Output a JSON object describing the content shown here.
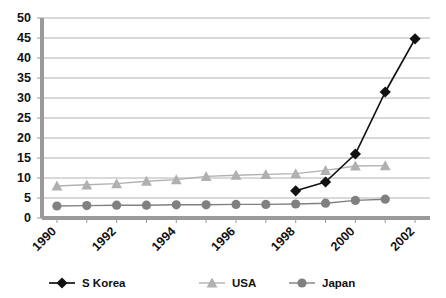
{
  "chart_data": {
    "type": "line",
    "title": "",
    "subtitle": "",
    "xlabel": "",
    "ylabel": "",
    "x": [
      1990,
      1991,
      1992,
      1993,
      1994,
      1995,
      1996,
      1997,
      1998,
      1999,
      2000,
      2001,
      2002
    ],
    "categories": [
      "1990",
      "1991",
      "1992",
      "1993",
      "1994",
      "1995",
      "1996",
      "1997",
      "1998",
      "1999",
      "2000",
      "2001",
      "2002"
    ],
    "xtick_labels": [
      "1990",
      "1992",
      "1994",
      "1996",
      "1998",
      "2000",
      "2002"
    ],
    "xtick_values": [
      1990,
      1992,
      1994,
      1996,
      1998,
      2000,
      2002
    ],
    "ytick_labels": [
      "0",
      "5",
      "10",
      "15",
      "20",
      "25",
      "30",
      "35",
      "40",
      "45",
      "50"
    ],
    "ytick_values": [
      0,
      5,
      10,
      15,
      20,
      25,
      30,
      35,
      40,
      45,
      50
    ],
    "xlim": [
      1989.5,
      2002.5
    ],
    "ylim": [
      0,
      50
    ],
    "grid": "horizontal",
    "legend_position": "bottom",
    "series": [
      {
        "name": "S Korea",
        "color": "#111111",
        "marker": "diamond",
        "x": [
          1998,
          1999,
          2000,
          2001,
          2002
        ],
        "values": [
          6.8,
          9.0,
          16.0,
          31.5,
          44.8
        ]
      },
      {
        "name": "USA",
        "color": "#b0b0b0",
        "marker": "triangle",
        "x": [
          1990,
          1991,
          1992,
          1993,
          1994,
          1995,
          1996,
          1997,
          1998,
          1999,
          2000,
          2001
        ],
        "values": [
          8.0,
          8.3,
          8.6,
          9.2,
          9.6,
          10.4,
          10.7,
          10.9,
          11.1,
          11.9,
          13.0,
          13.1
        ]
      },
      {
        "name": "Japan",
        "color": "#808080",
        "marker": "circle",
        "x": [
          1990,
          1991,
          1992,
          1993,
          1994,
          1995,
          1996,
          1997,
          1998,
          1999,
          2000,
          2001
        ],
        "values": [
          3.0,
          3.1,
          3.2,
          3.2,
          3.3,
          3.3,
          3.4,
          3.4,
          3.5,
          3.7,
          4.4,
          4.7
        ]
      }
    ]
  },
  "legend": {
    "items": [
      {
        "label": "S Korea",
        "color": "#111111",
        "marker": "diamond"
      },
      {
        "label": "USA",
        "color": "#b0b0b0",
        "marker": "triangle"
      },
      {
        "label": "Japan",
        "color": "#808080",
        "marker": "circle"
      }
    ]
  },
  "colors": {
    "skorea": "#111111",
    "usa": "#b0b0b0",
    "japan": "#808080",
    "grid": "#b3b3b3",
    "axis": "#9a9a9a",
    "background": "#ffffff",
    "text": "#111111"
  }
}
